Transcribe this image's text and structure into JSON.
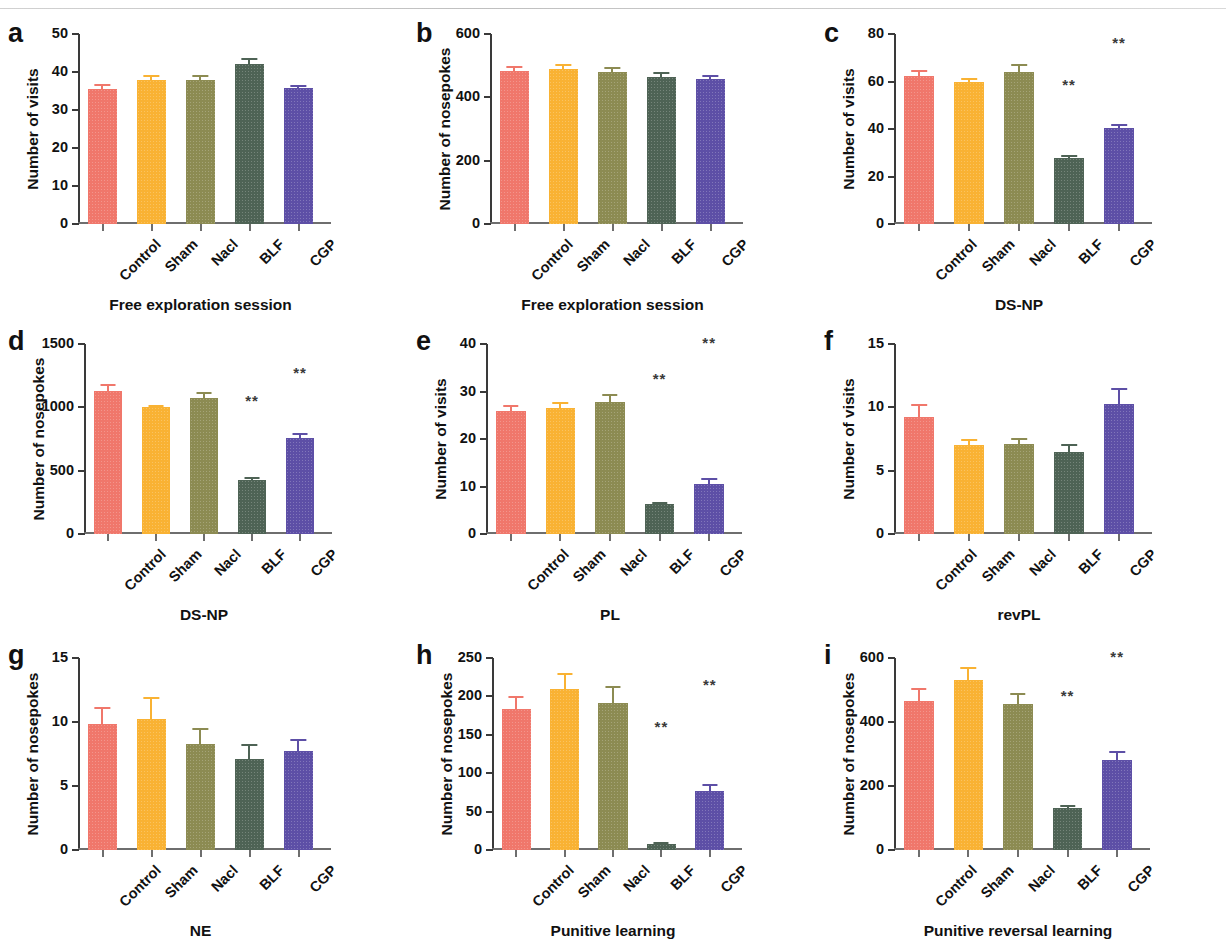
{
  "figure": {
    "categories": [
      "Control",
      "Sham",
      "Nacl",
      "BLF",
      "CGP"
    ],
    "colors": {
      "Control": "#F0776B",
      "Sham": "#F9B233",
      "Nacl": "#8C8B52",
      "BLF": "#4E6355",
      "CGP": "#5D4FA6"
    },
    "significance_marker": "**"
  },
  "chart_data": [
    {
      "panel": "a",
      "type": "bar",
      "title": "",
      "xlabel": "Free exploration session",
      "ylabel": "Number of visits",
      "categories": [
        "Control",
        "Sham",
        "Nacl",
        "BLF",
        "CGP"
      ],
      "values": [
        35.6,
        38.0,
        37.8,
        42.0,
        35.8
      ],
      "errors": [
        1.3,
        1.3,
        1.4,
        1.8,
        0.7
      ],
      "significance": [
        "",
        "",
        "",
        "",
        ""
      ],
      "ylim": [
        0,
        50
      ],
      "yticks": [
        0,
        10,
        20,
        30,
        40,
        50
      ],
      "grid": false,
      "legend": "none"
    },
    {
      "panel": "b",
      "type": "bar",
      "title": "",
      "xlabel": "Free exploration session",
      "ylabel": "Number of nosepokes",
      "categories": [
        "Control",
        "Sham",
        "Nacl",
        "BLF",
        "CGP"
      ],
      "values": [
        483,
        489,
        479,
        463,
        458
      ],
      "errors": [
        16,
        17,
        18,
        16,
        12
      ],
      "significance": [
        "",
        "",
        "",
        "",
        ""
      ],
      "ylim": [
        0,
        600
      ],
      "yticks": [
        0,
        200,
        400,
        600
      ],
      "grid": false,
      "legend": "none"
    },
    {
      "panel": "c",
      "type": "bar",
      "title": "",
      "xlabel": "DS-NP",
      "ylabel": "Number of visits",
      "categories": [
        "Control",
        "Sham",
        "Nacl",
        "BLF",
        "CGP"
      ],
      "values": [
        62.5,
        60.0,
        64.0,
        28.0,
        40.5
      ],
      "errors": [
        2.5,
        1.6,
        3.2,
        0.9,
        1.5
      ],
      "significance": [
        "",
        "",
        "",
        "**",
        "**"
      ],
      "significance_y": [
        0,
        0,
        0,
        55,
        73
      ],
      "ylim": [
        0,
        80
      ],
      "yticks": [
        0,
        20,
        40,
        60,
        80
      ],
      "grid": false,
      "legend": "none"
    },
    {
      "panel": "d",
      "type": "bar",
      "title": "",
      "xlabel": "DS-NP",
      "ylabel": "Number of nosepokes",
      "categories": [
        "Control",
        "Sham",
        "Nacl",
        "BLF",
        "CGP"
      ],
      "values": [
        1130,
        1000,
        1075,
        425,
        755
      ],
      "errors": [
        55,
        15,
        50,
        25,
        40
      ],
      "significance": [
        "",
        "",
        "",
        "**",
        "**"
      ],
      "significance_y": [
        0,
        0,
        0,
        990,
        1210
      ],
      "ylim": [
        0,
        1500
      ],
      "yticks": [
        0,
        500,
        1000,
        1500
      ],
      "grid": false,
      "legend": "none"
    },
    {
      "panel": "e",
      "type": "bar",
      "title": "",
      "xlabel": "PL",
      "ylabel": "Number of visits",
      "categories": [
        "Control",
        "Sham",
        "Nacl",
        "BLF",
        "CGP"
      ],
      "values": [
        26.0,
        26.5,
        27.8,
        6.3,
        10.5
      ],
      "errors": [
        1.1,
        1.3,
        1.6,
        0.3,
        1.2
      ],
      "significance": [
        "",
        "",
        "",
        "**",
        "**"
      ],
      "significance_y": [
        0,
        0,
        0,
        31,
        38.5
      ],
      "ylim": [
        0,
        40
      ],
      "yticks": [
        0,
        10,
        20,
        30,
        40
      ],
      "grid": false,
      "legend": "none"
    },
    {
      "panel": "f",
      "type": "bar",
      "title": "",
      "xlabel": "revPL",
      "ylabel": "Number of visits",
      "categories": [
        "Control",
        "Sham",
        "Nacl",
        "BLF",
        "CGP"
      ],
      "values": [
        9.2,
        7.0,
        7.1,
        6.5,
        10.3
      ],
      "errors": [
        1.1,
        0.5,
        0.5,
        0.6,
        1.2
      ],
      "significance": [
        "",
        "",
        "",
        "",
        ""
      ],
      "ylim": [
        0,
        15
      ],
      "yticks": [
        0,
        5,
        10,
        15
      ],
      "grid": false,
      "legend": "none"
    },
    {
      "panel": "g",
      "type": "bar",
      "title": "",
      "xlabel": "NE",
      "ylabel": "Number of nosepokes",
      "categories": [
        "Control",
        "Sham",
        "Nacl",
        "BLF",
        "CGP"
      ],
      "values": [
        9.85,
        10.25,
        8.25,
        7.1,
        7.7
      ],
      "errors": [
        1.35,
        1.7,
        1.3,
        1.15,
        0.95
      ],
      "significance": [
        "",
        "",
        "",
        "",
        ""
      ],
      "ylim": [
        0,
        15
      ],
      "yticks": [
        0,
        5,
        10,
        15
      ],
      "grid": false,
      "legend": "none"
    },
    {
      "panel": "h",
      "type": "bar",
      "title": "",
      "xlabel": "Punitive learning",
      "ylabel": "Number of nosepokes",
      "categories": [
        "Control",
        "Sham",
        "Nacl",
        "BLF",
        "CGP"
      ],
      "values": [
        184,
        210,
        192,
        8,
        77
      ],
      "errors": [
        16,
        20,
        21,
        2,
        9
      ],
      "significance": [
        "",
        "",
        "",
        "**",
        "**"
      ],
      "significance_y": [
        0,
        0,
        0,
        150,
        205
      ],
      "ylim": [
        0,
        250
      ],
      "yticks": [
        0,
        50,
        100,
        150,
        200,
        250
      ],
      "grid": false,
      "legend": "none"
    },
    {
      "panel": "i",
      "type": "bar",
      "title": "",
      "xlabel": "Punitive reversal learning",
      "ylabel": "Number of nosepokes",
      "categories": [
        "Control",
        "Sham",
        "Nacl",
        "BLF",
        "CGP"
      ],
      "values": [
        467,
        532,
        455,
        132,
        282
      ],
      "errors": [
        40,
        40,
        35,
        10,
        28
      ],
      "significance": [
        "",
        "",
        "",
        "**",
        "**"
      ],
      "significance_y": [
        0,
        0,
        0,
        455,
        578
      ],
      "ylim": [
        0,
        600
      ],
      "yticks": [
        0,
        200,
        400,
        600
      ],
      "grid": false,
      "legend": "none"
    }
  ]
}
